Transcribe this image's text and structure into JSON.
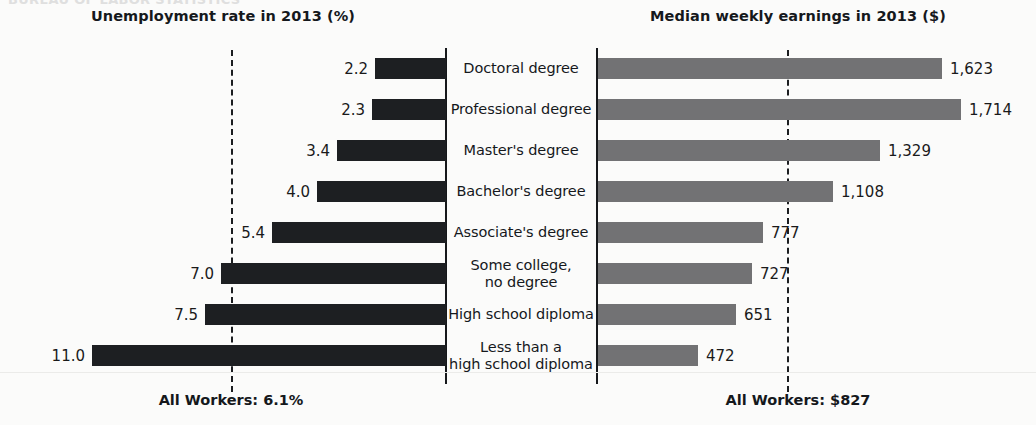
{
  "scan_artifact_text": "BUREAU OF LABOR STATISTICS",
  "left_panel": {
    "title": "Unemployment rate in 2013 (%)",
    "footer": "All Workers: 6.1%",
    "reference_value": 6.1
  },
  "right_panel": {
    "title": "Median weekly earnings in 2013 ($)",
    "footer": "All Workers: $827",
    "reference_value": 827
  },
  "chart_data": {
    "type": "bar",
    "orientation": "horizontal-diverging",
    "categories": [
      "Doctoral degree",
      "Professional degree",
      "Master's degree",
      "Bachelor's degree",
      "Associate's degree",
      "Some college,\nno degree",
      "High school diploma",
      "Less than a\nhigh school diploma"
    ],
    "category_lines": [
      [
        "Doctoral degree"
      ],
      [
        "Professional degree"
      ],
      [
        "Master's degree"
      ],
      [
        "Bachelor's degree"
      ],
      [
        "Associate's degree"
      ],
      [
        "Some college,",
        "no degree"
      ],
      [
        "High school diploma"
      ],
      [
        "Less than a",
        "high school diploma"
      ]
    ],
    "series": [
      {
        "name": "Unemployment rate in 2013 (%)",
        "side": "left",
        "unit": "%",
        "color": "#1d1f22",
        "values": [
          2.2,
          2.3,
          3.4,
          4.0,
          5.4,
          7.0,
          7.5,
          11.0
        ],
        "labels": [
          "2.2",
          "2.3",
          "3.4",
          "4.0",
          "5.4",
          "7.0",
          "7.5",
          "11.0"
        ],
        "axis_max": 12.0,
        "reference_line": {
          "value": 6.1,
          "label": "All Workers: 6.1%"
        }
      },
      {
        "name": "Median weekly earnings in 2013 ($)",
        "side": "right",
        "unit": "$",
        "color": "#727274",
        "values": [
          1623,
          1714,
          1329,
          1108,
          777,
          727,
          651,
          472
        ],
        "labels": [
          "1,623",
          "1,714",
          "1,329",
          "1,108",
          "777",
          "727",
          "651",
          "472"
        ],
        "axis_max": 1850,
        "reference_line": {
          "value": 827,
          "label": "All Workers: $827"
        }
      }
    ],
    "xlabel": "",
    "ylabel": "",
    "grid": false,
    "legend": "none",
    "note": "Diverging bar chart: unemployment rate bars extend left, median weekly earnings bars extend right, category labels centered."
  },
  "colors": {
    "background": "#fbfbfa",
    "unemployment_bar": "#1d1f22",
    "earnings_bar": "#727274",
    "axis": "#16181b",
    "text": "#15181c"
  }
}
